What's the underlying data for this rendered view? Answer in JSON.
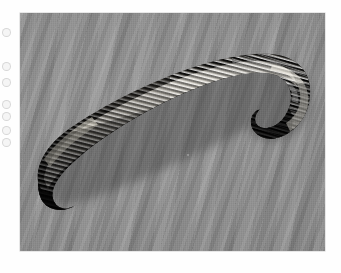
{
  "page": {
    "kind": "scanned-photograph",
    "background_color": "#ffffff",
    "width_px": 341,
    "height_px": 273,
    "caption": "",
    "title": ""
  },
  "photo": {
    "name": "leech-specimen-photograph",
    "left_px": 20,
    "top_px": 13,
    "width_px": 305,
    "height_px": 238,
    "background_color": "#8a8a8a",
    "background_description": "gray cloth-like surface with diagonal ripple texture",
    "subject": "leech",
    "subject_color_dark": "#100f0e",
    "subject_color_mid": "#3a3733",
    "subject_highlight": "#efece4",
    "orientation": "anterior end upper right, posterior end lower left",
    "features": [
      "annulated ridged body segments",
      "bright specular highlights along dorsal ridge",
      "curved hooked anterior end",
      "blunt rounded posterior end",
      "cast shadow beneath body"
    ]
  },
  "margin_artifacts": {
    "name": "scan-artifacts",
    "description": "faint circular marks along the left white margin",
    "positions_y_px": [
      28,
      62,
      78,
      100,
      112,
      126,
      138
    ]
  }
}
